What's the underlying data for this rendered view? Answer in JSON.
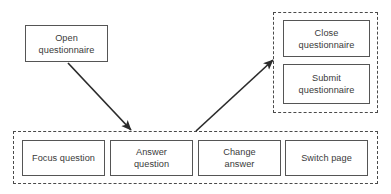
{
  "diagram": {
    "colors": {
      "node_border": "#555555",
      "group_border": "#4a4a4a",
      "text": "#3a3a3a",
      "arrow": "#2b2b2b",
      "background": "#ffffff"
    },
    "nodes": [
      {
        "id": "open-questionnaire",
        "label": "Open\nquestionnaire",
        "x": 25,
        "y": 25,
        "width": 83,
        "height": 37
      },
      {
        "id": "close-questionnaire",
        "label": "Close\nquestionnaire",
        "x": 283,
        "y": 20,
        "width": 87,
        "height": 37
      },
      {
        "id": "submit-questionnaire",
        "label": "Submit\nquestionnaire",
        "x": 283,
        "y": 64,
        "width": 87,
        "height": 40
      },
      {
        "id": "focus-question",
        "label": "Focus question",
        "x": 22,
        "y": 140,
        "width": 83,
        "height": 36
      },
      {
        "id": "answer-question",
        "label": "Answer\nquestion",
        "x": 110,
        "y": 140,
        "width": 83,
        "height": 36
      },
      {
        "id": "change-answer",
        "label": "Change\nanswer",
        "x": 198,
        "y": 140,
        "width": 83,
        "height": 36
      },
      {
        "id": "switch-page",
        "label": "Switch page",
        "x": 285,
        "y": 140,
        "width": 83,
        "height": 36
      }
    ],
    "groups": [
      {
        "id": "closing-group",
        "x": 273,
        "y": 12,
        "width": 105,
        "height": 101
      },
      {
        "id": "answering-group",
        "x": 13,
        "y": 131,
        "width": 365,
        "height": 53
      }
    ],
    "arrows": [
      {
        "id": "open-to-answering",
        "from": "open-questionnaire",
        "to": "answering-group",
        "x1": 68,
        "y1": 63,
        "x2": 131,
        "y2": 130
      },
      {
        "id": "answering-to-closing",
        "from": "answering-group",
        "to": "closing-group",
        "x1": 196,
        "y1": 131,
        "x2": 273,
        "y2": 60
      }
    ]
  }
}
